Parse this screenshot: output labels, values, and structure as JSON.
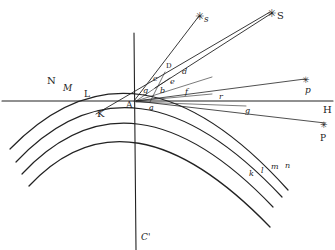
{
  "diagram": {
    "type": "geometric optics figure (rainbow / refraction arcs with rays to stars)",
    "colors": {
      "ink": "#222222",
      "background": "#ffffff"
    },
    "arcs_upper_labels": [
      "N",
      "M",
      "L",
      "K"
    ],
    "arcs_lower_labels": [
      "n",
      "m",
      "l",
      "k"
    ],
    "axis_labels": {
      "horizontal_end": "H",
      "vertical_bottom": "C'",
      "origin": "A"
    },
    "point_labels": {
      "D": "D",
      "d": "d",
      "c": "c",
      "e": "e",
      "b": "b",
      "g_small": "g",
      "a": "a",
      "f": "f",
      "r": "r",
      "g": "g"
    },
    "star_labels": {
      "s": "s",
      "S": "S",
      "p": "p",
      "P": "P"
    },
    "star_glyph": "✳"
  }
}
